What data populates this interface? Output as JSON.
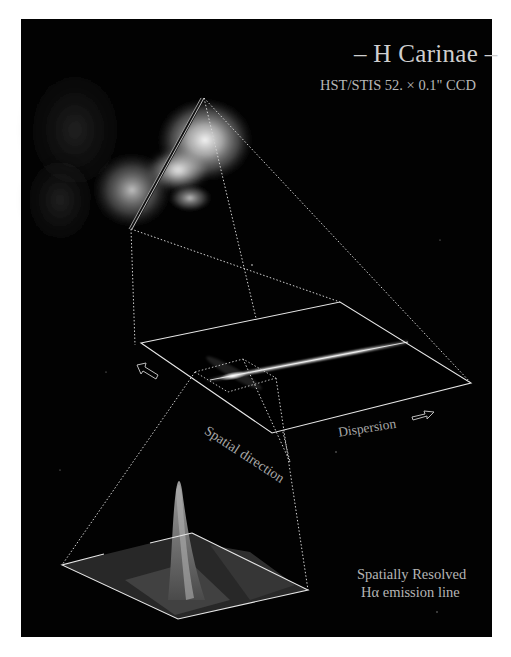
{
  "figure": {
    "title": "– H Carinae –",
    "subtitle": "HST/STIS 52. × 0.1\" CCD",
    "axis_labels": {
      "spatial": "Spatial direction",
      "dispersion": "Dispersion"
    },
    "caption": {
      "line1": "Spatially Resolved",
      "line2": "Hα emission line"
    },
    "icons": {
      "spatial_arrow": "hollow-arrow-up-left-icon",
      "dispersion_arrow": "hollow-arrow-right-icon"
    },
    "colors": {
      "background": "#020202",
      "frame_line": "#e6e6e6",
      "dotted_line": "#d0d0d0",
      "text": "#bdbdbd"
    }
  }
}
